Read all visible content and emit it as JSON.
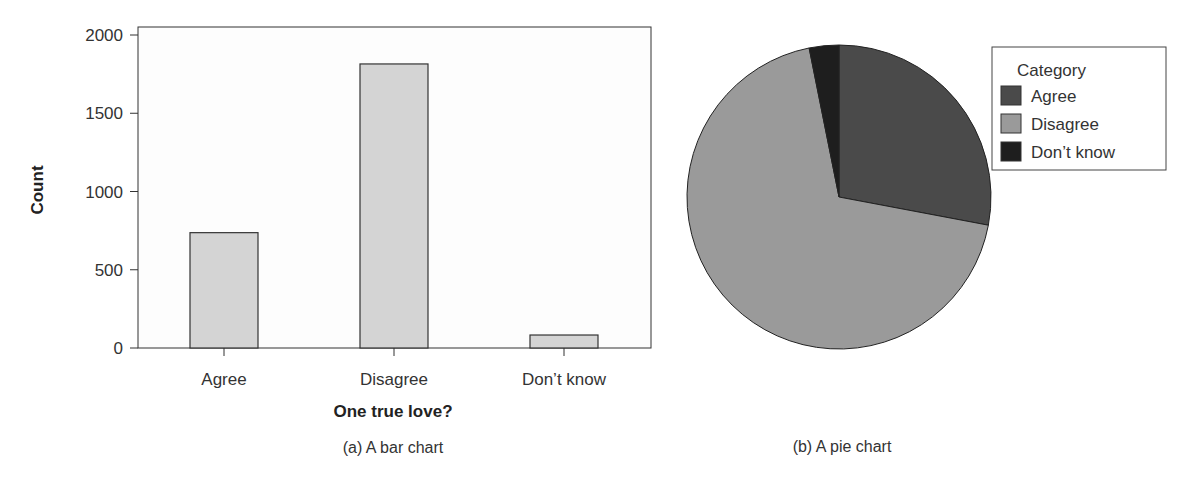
{
  "chart_data": [
    {
      "type": "bar",
      "title": "",
      "caption": "(a) A bar chart",
      "xlabel": "One true love?",
      "ylabel": "Count",
      "categories": [
        "Agree",
        "Disagree",
        "Don’t know"
      ],
      "values": [
        737,
        1815,
        83
      ],
      "ylim": [
        0,
        2000
      ],
      "yticks": [
        "0",
        "500",
        "1000",
        "1500",
        "2000"
      ],
      "grid": false,
      "bar_color": "#d4d4d4"
    },
    {
      "type": "pie",
      "title": "",
      "caption": "(b) A pie chart",
      "legend_title": "Category",
      "legend_position": "top-right",
      "categories": [
        "Agree",
        "Disagree",
        "Don’t know"
      ],
      "values": [
        737,
        1815,
        83
      ],
      "colors": [
        "#4a4a4a",
        "#9a9a9a",
        "#1e1e1e"
      ]
    }
  ]
}
